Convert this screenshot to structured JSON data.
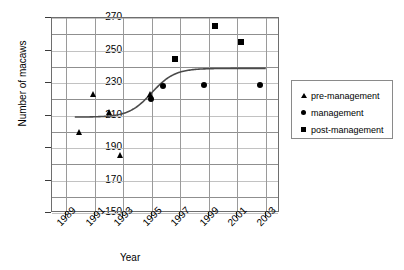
{
  "chart_data": {
    "type": "scatter",
    "title": "",
    "xlabel": "Year",
    "ylabel": "Number of macaws",
    "xlim": [
      1988,
      2004
    ],
    "ylim": [
      150,
      270
    ],
    "ytick_labels": [
      "270",
      "250",
      "230",
      "210",
      "190",
      "170",
      "150"
    ],
    "ytick_values": [
      270,
      250,
      230,
      210,
      190,
      170,
      150
    ],
    "ytick_step": 20,
    "minor_gridlines": true,
    "minor_gridline_step": 10,
    "xtick_labels": [
      "1989",
      "1991",
      "1993",
      "1995",
      "1997",
      "1999",
      "2001",
      "2003"
    ],
    "xtick_values": [
      1989,
      1991,
      1993,
      1995,
      1997,
      1999,
      2001,
      2003
    ],
    "grid": true,
    "legend_position": "right",
    "series": [
      {
        "name": "pre-management",
        "marker": "triangle",
        "color": "#000000",
        "points": [
          {
            "x": 1989.9,
            "y": 200
          },
          {
            "x": 1990.9,
            "y": 223
          },
          {
            "x": 1992.0,
            "y": 212
          },
          {
            "x": 1992.8,
            "y": 186
          },
          {
            "x": 1994.9,
            "y": 223
          }
        ]
      },
      {
        "name": "management",
        "marker": "circle",
        "color": "#000000",
        "points": [
          {
            "x": 1995.0,
            "y": 220
          },
          {
            "x": 1995.8,
            "y": 228
          },
          {
            "x": 1998.7,
            "y": 229
          },
          {
            "x": 2002.6,
            "y": 229
          }
        ]
      },
      {
        "name": "post-management",
        "marker": "square",
        "color": "#000000",
        "points": [
          {
            "x": 1996.7,
            "y": 245
          },
          {
            "x": 1999.5,
            "y": 265
          },
          {
            "x": 2001.3,
            "y": 255
          }
        ]
      }
    ],
    "fit_curve": {
      "name": "sigmoid-trend-line",
      "color": "#4a4a4a",
      "description": "logistic curve rising from 209 to 239",
      "lower_asymptote": 209,
      "upper_asymptote": 239,
      "midpoint_year": 1995.0,
      "steepness": 1.25,
      "x_start": 1989.6,
      "x_end": 2003.0
    }
  },
  "legend": {
    "items": [
      {
        "label": "pre-management",
        "marker": "triangle"
      },
      {
        "label": "management",
        "marker": "circle"
      },
      {
        "label": "post-management",
        "marker": "square"
      }
    ]
  }
}
